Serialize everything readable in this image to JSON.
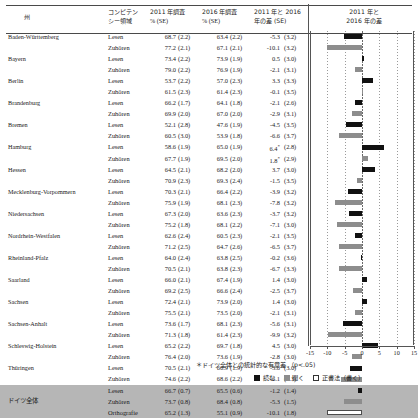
{
  "header": {
    "state": "州",
    "competency": [
      "コンピテン",
      "シー領域"
    ],
    "survey_2011": [
      "2011 年調査",
      "%    (SE)"
    ],
    "survey_2016": [
      "2016 年調査",
      "%    (SE)"
    ],
    "difference": [
      "2011 年と 2016",
      "年の差 (SE)"
    ],
    "chart_title": [
      "2011 年と",
      "2016 年の差"
    ]
  },
  "footnote": "＊ドイツ全体との統計的な有意差 （p<.05)",
  "legend": [
    {
      "key": "lesen",
      "label": "読む",
      "color": "#111111"
    },
    {
      "key": "hoeren",
      "label": "聞く",
      "color": "#8d8d8d"
    },
    {
      "key": "orthografie",
      "label": "正書法（書く）",
      "color": "#ffffff"
    }
  ],
  "axis": {
    "ticks": [
      "-15",
      "-10",
      "-5",
      "0",
      "5",
      "10",
      "15"
    ],
    "min": -15,
    "max": 15
  },
  "chart_data": {
    "type": "bar",
    "orientation": "horizontal",
    "title": "2011 年と 2016 年の差",
    "xlabel": "",
    "ylabel": "",
    "xlim": [
      -15,
      15
    ],
    "grid": true,
    "legend_position": "bottom",
    "categories": [
      "Baden-Württemberg Lesen",
      "Baden-Württemberg Zuhören",
      "Bayern Lesen",
      "Bayern Zuhören",
      "Berlin Lesen",
      "Berlin Zuhören",
      "Brandenburg Lesen",
      "Brandenburg Zuhören",
      "Bremen Lesen",
      "Bremen Zuhören",
      "Hamburg Lesen",
      "Hamburg Zuhören",
      "Hessen Lesen",
      "Hessen Zuhören",
      "Mecklenburg-Vorpommern Lesen",
      "Mecklenburg-Vorpommern Zuhören",
      "Niedersachsen Lesen",
      "Niedersachsen Zuhören",
      "Nordrhein-Westfalen Lesen",
      "Nordrhein-Westfalen Zuhören",
      "Rheinland-Pfalz Lesen",
      "Rheinland-Pfalz Zuhören",
      "Saarland Lesen",
      "Saarland Zuhören",
      "Sachsen Lesen",
      "Sachsen Zuhören",
      "Sachsen-Anhalt Lesen",
      "Sachsen-Anhalt Zuhören",
      "Schleswig-Holstein Lesen",
      "Schleswig-Holstein Zuhören",
      "Thüringen Lesen",
      "Thüringen Zuhören",
      "ドイツ全体 Lesen",
      "ドイツ全体 Zuhören",
      "ドイツ全体 Orthografie"
    ],
    "values": [
      -5.3,
      -10.1,
      0.5,
      -2.1,
      3.3,
      -0.1,
      -2.1,
      -2.9,
      -4.5,
      -6.6,
      6.4,
      1.8,
      3.7,
      -1.5,
      -3.9,
      -7.8,
      -3.7,
      -7.1,
      -2.1,
      -6.5,
      -0.2,
      -6.7,
      1.4,
      -2.5,
      1.4,
      -2.1,
      -5.6,
      -9.9,
      4.5,
      -2.8,
      -3.6,
      -6.1,
      -1.2,
      -5.3,
      -10.1
    ]
  },
  "rows": [
    {
      "state": "Baden-Württemberg",
      "comp": "Lesen",
      "v2011": "68.7",
      "s2011": "(2.2)",
      "v2016": "63.4",
      "s2016": "(2.2)",
      "diff": "-5.3",
      "sig": "",
      "sdiff": "(3.2)",
      "series": "lesen",
      "val": -5.3
    },
    {
      "state": "",
      "comp": "Zuhören",
      "v2011": "77.2",
      "s2011": "(2.1)",
      "v2016": "67.1",
      "s2016": "(2.1)",
      "diff": "-10.1",
      "sig": "",
      "sdiff": "(3.2)",
      "series": "hoeren",
      "val": -10.1
    },
    {
      "state": "Bayern",
      "comp": "Lesen",
      "v2011": "73.4",
      "s2011": "(2.2)",
      "v2016": "73.9",
      "s2016": "(1.9)",
      "diff": "0.5",
      "sig": "",
      "sdiff": "(3.0)",
      "series": "lesen",
      "val": 0.5
    },
    {
      "state": "",
      "comp": "Zuhören",
      "v2011": "79.0",
      "s2011": "(2.2)",
      "v2016": "76.9",
      "s2016": "(1.9)",
      "diff": "-2.1",
      "sig": "",
      "sdiff": "(3.1)",
      "series": "hoeren",
      "val": -2.1
    },
    {
      "state": "Berlin",
      "comp": "Lesen",
      "v2011": "53.7",
      "s2011": "(2.2)",
      "v2016": "57.0",
      "s2016": "(2.3)",
      "diff": "3.3",
      "sig": "",
      "sdiff": "(3.3)",
      "series": "lesen",
      "val": 3.3
    },
    {
      "state": "",
      "comp": "Zuhören",
      "v2011": "61.5",
      "s2011": "(2.3)",
      "v2016": "61.4",
      "s2016": "(2.3)",
      "diff": "-0.1",
      "sig": "",
      "sdiff": "(3.5)",
      "series": "hoeren",
      "val": -0.1
    },
    {
      "state": "Brandenburg",
      "comp": "Lesen",
      "v2011": "66.2",
      "s2011": "(1.7)",
      "v2016": "64.1",
      "s2016": "(1.8)",
      "diff": "-2.1",
      "sig": "",
      "sdiff": "(2.6)",
      "series": "lesen",
      "val": -2.1
    },
    {
      "state": "",
      "comp": "Zuhören",
      "v2011": "69.9",
      "s2011": "(2.0)",
      "v2016": "67.0",
      "s2016": "(2.0)",
      "diff": "-2.9",
      "sig": "",
      "sdiff": "(3.1)",
      "series": "hoeren",
      "val": -2.9
    },
    {
      "state": "Bremen",
      "comp": "Lesen",
      "v2011": "52.1",
      "s2011": "(2.8)",
      "v2016": "47.6",
      "s2016": "(1.9)",
      "diff": "-4.5",
      "sig": "",
      "sdiff": "(3.5)",
      "series": "lesen",
      "val": -4.5
    },
    {
      "state": "",
      "comp": "Zuhören",
      "v2011": "60.5",
      "s2011": "(3.0)",
      "v2016": "53.9",
      "s2016": "(1.8)",
      "diff": "-6.6",
      "sig": "",
      "sdiff": "(3.7)",
      "series": "hoeren",
      "val": -6.6
    },
    {
      "state": "Hamburg",
      "comp": "Lesen",
      "v2011": "58.6",
      "s2011": "(1.9)",
      "v2016": "65.0",
      "s2016": "(1.9)",
      "diff": "6.4",
      "sig": "*",
      "sdiff": "(2.8)",
      "series": "lesen",
      "val": 6.4
    },
    {
      "state": "",
      "comp": "Zuhören",
      "v2011": "67.7",
      "s2011": "(1.9)",
      "v2016": "69.5",
      "s2016": "(2.0)",
      "diff": "1.8",
      "sig": "*",
      "sdiff": "(2.9)",
      "series": "hoeren",
      "val": 1.8
    },
    {
      "state": "Hessen",
      "comp": "Lesen",
      "v2011": "64.5",
      "s2011": "(2.1)",
      "v2016": "68.2",
      "s2016": "(2.0)",
      "diff": "3.7",
      "sig": "",
      "sdiff": "(3.0)",
      "series": "lesen",
      "val": 3.7
    },
    {
      "state": "",
      "comp": "Zuhören",
      "v2011": "70.9",
      "s2011": "(2.3)",
      "v2016": "69.3",
      "s2016": "(2.4)",
      "diff": "-1.5",
      "sig": "",
      "sdiff": "(3.5)",
      "series": "hoeren",
      "val": -1.5
    },
    {
      "state": "Mecklenburg-Vorpommern",
      "comp": "Lesen",
      "v2011": "70.3",
      "s2011": "(2.1)",
      "v2016": "66.4",
      "s2016": "(2.2)",
      "diff": "-3.9",
      "sig": "",
      "sdiff": "(3.2)",
      "series": "lesen",
      "val": -3.9
    },
    {
      "state": "",
      "comp": "Zuhören",
      "v2011": "75.9",
      "s2011": "(1.9)",
      "v2016": "68.1",
      "s2016": "(2.3)",
      "diff": "-7.8",
      "sig": "",
      "sdiff": "(3.2)",
      "series": "hoeren",
      "val": -7.8
    },
    {
      "state": "Niedersachsen",
      "comp": "Lesen",
      "v2011": "67.3",
      "s2011": "(2.0)",
      "v2016": "63.6",
      "s2016": "(2.3)",
      "diff": "-3.7",
      "sig": "",
      "sdiff": "(3.2)",
      "series": "lesen",
      "val": -3.7
    },
    {
      "state": "",
      "comp": "Zuhören",
      "v2011": "75.2",
      "s2011": "(1.8)",
      "v2016": "68.1",
      "s2016": "(2.2)",
      "diff": "-7.1",
      "sig": "",
      "sdiff": "(3.0)",
      "series": "hoeren",
      "val": -7.1
    },
    {
      "state": "Nordrhein-Westfalen",
      "comp": "Lesen",
      "v2011": "62.6",
      "s2011": "(2.4)",
      "v2016": "60.5",
      "s2016": "(2.3)",
      "diff": "-2.1",
      "sig": "",
      "sdiff": "(3.5)",
      "series": "lesen",
      "val": -2.1
    },
    {
      "state": "",
      "comp": "Zuhören",
      "v2011": "71.2",
      "s2011": "(2.5)",
      "v2016": "64.7",
      "s2016": "(2.6)",
      "diff": "-6.5",
      "sig": "",
      "sdiff": "(3.7)",
      "series": "hoeren",
      "val": -6.5
    },
    {
      "state": "Rheinland-Pfalz",
      "comp": "Lesen",
      "v2011": "64.0",
      "s2011": "(2.4)",
      "v2016": "63.8",
      "s2016": "(2.5)",
      "diff": "-0.2",
      "sig": "",
      "sdiff": "(3.6)",
      "series": "lesen",
      "val": -0.2
    },
    {
      "state": "",
      "comp": "Zuhören",
      "v2011": "70.5",
      "s2011": "(2.1)",
      "v2016": "63.8",
      "s2016": "(2.3)",
      "diff": "-6.7",
      "sig": "",
      "sdiff": "(3.3)",
      "series": "hoeren",
      "val": -6.7
    },
    {
      "state": "Saarland",
      "comp": "Lesen",
      "v2011": "66.0",
      "s2011": "(2.1)",
      "v2016": "67.4",
      "s2016": "(1.9)",
      "diff": "1.4",
      "sig": "",
      "sdiff": "(3.0)",
      "series": "lesen",
      "val": 1.4
    },
    {
      "state": "",
      "comp": "Zuhören",
      "v2011": "69.2",
      "s2011": "(2.5)",
      "v2016": "66.6",
      "s2016": "(2.4)",
      "diff": "-2.5",
      "sig": "",
      "sdiff": "(3.7)",
      "series": "hoeren",
      "val": -2.5
    },
    {
      "state": "Sachsen",
      "comp": "Lesen",
      "v2011": "72.4",
      "s2011": "(2.1)",
      "v2016": "73.9",
      "s2016": "(2.0)",
      "diff": "1.4",
      "sig": "",
      "sdiff": "(3.0)",
      "series": "lesen",
      "val": 1.4
    },
    {
      "state": "",
      "comp": "Zuhören",
      "v2011": "75.5",
      "s2011": "(2.1)",
      "v2016": "73.5",
      "s2016": "(2.0)",
      "diff": "-2.1",
      "sig": "",
      "sdiff": "(3.1)",
      "series": "hoeren",
      "val": -2.1
    },
    {
      "state": "Sachsen-Anhalt",
      "comp": "Lesen",
      "v2011": "73.6",
      "s2011": "(1.7)",
      "v2016": "68.1",
      "s2016": "(2.3)",
      "diff": "-5.6",
      "sig": "",
      "sdiff": "(3.1)",
      "series": "lesen",
      "val": -5.6
    },
    {
      "state": "",
      "comp": "Zuhören",
      "v2011": "71.3",
      "s2011": "(1.8)",
      "v2016": "61.4",
      "s2016": "(2.3)",
      "diff": "-9.9",
      "sig": "",
      "sdiff": "(3.2)",
      "series": "hoeren",
      "val": -9.9
    },
    {
      "state": "Schleswig-Holstein",
      "comp": "Lesen",
      "v2011": "65.2",
      "s2011": "(2.2)",
      "v2016": "69.7",
      "s2016": "(1.8)",
      "diff": "4.5",
      "sig": "",
      "sdiff": "(3.0)",
      "series": "lesen",
      "val": 4.5
    },
    {
      "state": "",
      "comp": "Zuhören",
      "v2011": "76.4",
      "s2011": "(2.0)",
      "v2016": "73.6",
      "s2016": "(1.9)",
      "diff": "-2.8",
      "sig": "",
      "sdiff": "(3.0)",
      "series": "hoeren",
      "val": -2.8
    },
    {
      "state": "Thüringen",
      "comp": "Lesen",
      "v2011": "70.5",
      "s2011": "(2.1)",
      "v2016": "66.9",
      "s2016": "(1.9)",
      "diff": "-3.6",
      "sig": "",
      "sdiff": "(3.0)",
      "series": "lesen",
      "val": -3.6
    },
    {
      "state": "",
      "comp": "Zuhören",
      "v2011": "74.6",
      "s2011": "(2.2)",
      "v2016": "68.6",
      "s2016": "(2.2)",
      "diff": "-6.1",
      "sig": "",
      "sdiff": "(3.3)",
      "series": "hoeren",
      "val": -6.1
    },
    {
      "state": "",
      "comp": "Lesen",
      "v2011": "66.7",
      "s2011": "(0.7)",
      "v2016": "65.5",
      "s2016": "(0.6)",
      "diff": "-1.2",
      "sig": "",
      "sdiff": "(1.4)",
      "series": "lesen",
      "val": -1.2,
      "shaded": true
    },
    {
      "state": "ドイツ全体",
      "comp": "Zuhören",
      "v2011": "73.7",
      "s2011": "(0.8)",
      "v2016": "68.4",
      "s2016": "(0.8)",
      "diff": "-5.3",
      "sig": "",
      "sdiff": "(1.5)",
      "series": "hoeren",
      "val": -5.3,
      "shaded": true,
      "state_jp": true
    },
    {
      "state": "",
      "comp": "Orthografie",
      "v2011": "65.2",
      "s2011": "(1.3)",
      "v2016": "55.1",
      "s2016": "(0.9)",
      "diff": "-10.1",
      "sig": "",
      "sdiff": "(1.8)",
      "series": "ortho",
      "val": -10.1,
      "shaded": true
    }
  ]
}
